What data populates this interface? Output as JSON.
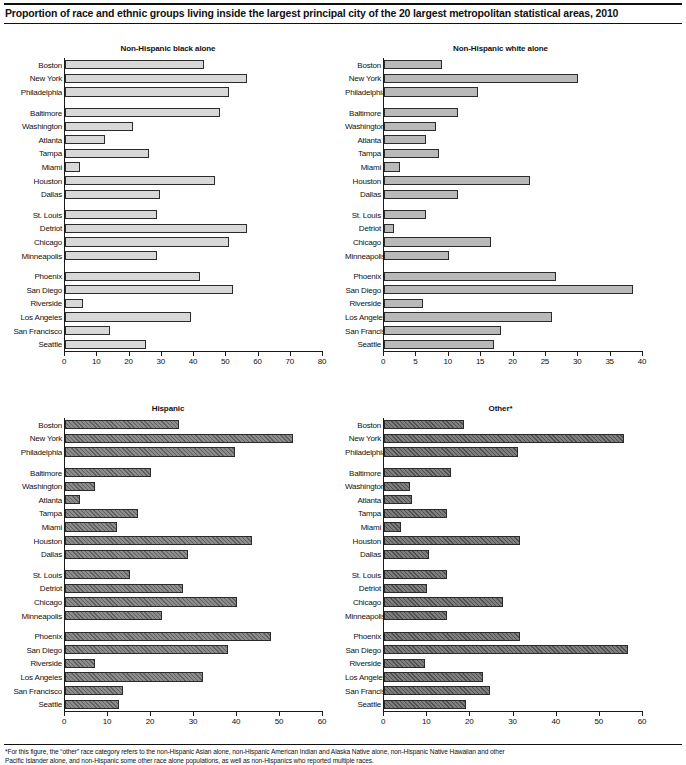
{
  "figure": {
    "title": "Proportion of race and ethnic groups living inside the largest principal city of the 20 largest metropolitan statistical areas, 2010",
    "footnote_line1": "*For this figure, the “other” race category refers to the non-Hispanic Asian alone, non-Hispanic American Indian and Alaska Native alone, non-Hispanic Native Hawaiian and other",
    "footnote_line2": "Pacific Islander alone, and non-Hispanic some other race alone populations, as well as non-Hispanics who reported multiple races."
  },
  "cities": [
    "Boston",
    "New York",
    "Philadelphia",
    "Baltimore",
    "Washington",
    "Atlanta",
    "Tampa",
    "Miami",
    "Houston",
    "Dallas",
    "St. Louis",
    "Detriot",
    "Chicago",
    "Minneapolis",
    "Phoenix",
    "San Diego",
    "Riverside",
    "Los Angeles",
    "San Francisco",
    "Seattle"
  ],
  "chart_data": [
    {
      "type": "bar",
      "title": "Non-Hispanic black alone",
      "orientation": "horizontal",
      "panel": "top-left",
      "xlabel": "",
      "ylabel": "",
      "xlim": [
        0,
        80
      ],
      "xticks": [
        0,
        10,
        20,
        30,
        40,
        50,
        60,
        70,
        80
      ],
      "grid": false,
      "legend": "none",
      "bar_style": "light",
      "categories": [
        "Boston",
        "New York",
        "Philadelphia",
        "Baltimore",
        "Washington",
        "Atlanta",
        "Tampa",
        "Miami",
        "Houston",
        "Dallas",
        "St. Louis",
        "Detriot",
        "Chicago",
        "Minneapolis",
        "Phoenix",
        "San Diego",
        "Riverside",
        "Los Angeles",
        "San Francisco",
        "Seattle"
      ],
      "values": [
        43.0,
        56.5,
        51.0,
        48.0,
        21.0,
        12.5,
        26.0,
        4.5,
        46.5,
        29.5,
        28.5,
        56.5,
        51.0,
        28.5,
        42.0,
        52.0,
        5.5,
        39.0,
        14.0,
        25.0
      ]
    },
    {
      "type": "bar",
      "title": "Non-Hispanic white alone",
      "orientation": "horizontal",
      "panel": "top-right",
      "xlabel": "",
      "ylabel": "",
      "xlim": [
        0,
        40
      ],
      "xticks": [
        0,
        5,
        10,
        15,
        20,
        25,
        30,
        35,
        40
      ],
      "grid": false,
      "legend": "none",
      "bar_style": "mid",
      "categories": [
        "Boston",
        "New York",
        "Philadelphia",
        "Baltimore",
        "Washington",
        "Atlanta",
        "Tampa",
        "Miami",
        "Houston",
        "Dallas",
        "St. Louis",
        "Detriot",
        "Chicago",
        "Minneapolis",
        "Phoenix",
        "San Diego",
        "Riverside",
        "Los Angeles",
        "San Francisco",
        "Seattle"
      ],
      "values": [
        9.0,
        30.0,
        14.5,
        11.5,
        8.0,
        6.5,
        8.5,
        2.5,
        22.5,
        11.5,
        6.5,
        1.5,
        16.5,
        10.0,
        26.5,
        38.5,
        6.0,
        26.0,
        18.0,
        17.0
      ]
    },
    {
      "type": "bar",
      "title": "Hispanic",
      "orientation": "horizontal",
      "panel": "bottom-left",
      "xlabel": "",
      "ylabel": "",
      "xlim": [
        0,
        60
      ],
      "xticks": [
        0,
        10,
        20,
        30,
        40,
        50,
        60
      ],
      "grid": false,
      "legend": "none",
      "bar_style": "dark",
      "categories": [
        "Boston",
        "New York",
        "Philadelphia",
        "Baltimore",
        "Washington",
        "Atlanta",
        "Tampa",
        "Miami",
        "Houston",
        "Dallas",
        "St. Louis",
        "Detriot",
        "Chicago",
        "Minneapolis",
        "Phoenix",
        "San Diego",
        "Riverside",
        "Los Angeles",
        "San Francisco",
        "Seattle"
      ],
      "values": [
        26.5,
        53.0,
        39.5,
        20.0,
        7.0,
        3.5,
        17.0,
        12.0,
        43.5,
        28.5,
        15.0,
        27.5,
        40.0,
        22.5,
        48.0,
        38.0,
        7.0,
        32.0,
        13.5,
        12.5
      ]
    },
    {
      "type": "bar",
      "title": "Other*",
      "orientation": "horizontal",
      "panel": "bottom-right",
      "xlabel": "",
      "ylabel": "",
      "xlim": [
        0,
        60
      ],
      "xticks": [
        0,
        10,
        20,
        30,
        40,
        50,
        60
      ],
      "grid": false,
      "legend": "none",
      "bar_style": "darker",
      "categories": [
        "Boston",
        "New York",
        "Philadelphia",
        "Baltimore",
        "Washington",
        "Atlanta",
        "Tampa",
        "Miami",
        "Houston",
        "Dallas",
        "St. Louis",
        "Detriot",
        "Chicago",
        "Minneapolis",
        "Phoenix",
        "San Diego",
        "Riverside",
        "Los Angeles",
        "San Francisco",
        "Seattle"
      ],
      "values": [
        18.5,
        55.5,
        31.0,
        15.5,
        6.0,
        6.5,
        14.5,
        4.0,
        31.5,
        10.5,
        14.5,
        10.0,
        27.5,
        14.5,
        31.5,
        56.5,
        9.5,
        23.0,
        24.5,
        19.0
      ]
    }
  ]
}
